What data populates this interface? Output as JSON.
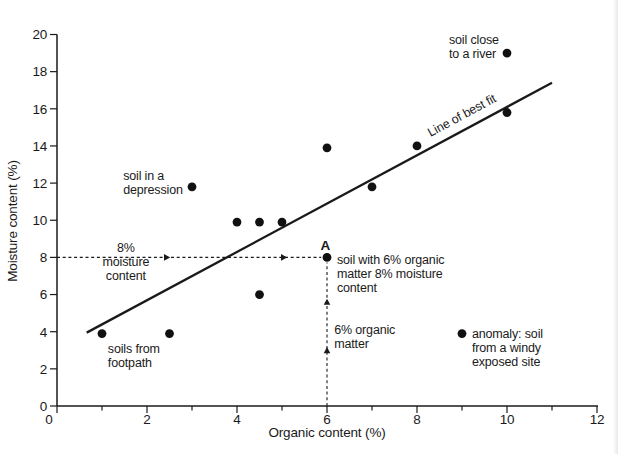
{
  "figure": {
    "background": "#ffffff",
    "ink_color": "#1a1a1a"
  },
  "chart_data": {
    "type": "scatter",
    "title": "",
    "xlabel": "Organic content (%)",
    "ylabel": "Moisture content (%)",
    "xlim": [
      0,
      12
    ],
    "ylim": [
      0,
      20
    ],
    "grid": false,
    "x_major_ticks": [
      0,
      2,
      4,
      6,
      8,
      10,
      12
    ],
    "x_minor_ticks": [
      1,
      3,
      5,
      7,
      9,
      11
    ],
    "y_major_ticks": [
      0,
      2,
      4,
      6,
      8,
      10,
      12,
      14,
      16,
      18,
      20
    ],
    "points": [
      {
        "x": 1,
        "y": 3.9,
        "note": "soils from footpath"
      },
      {
        "x": 2.5,
        "y": 3.9,
        "note": "soils from footpath"
      },
      {
        "x": 3,
        "y": 11.8,
        "note": "soil in a depression"
      },
      {
        "x": 4,
        "y": 9.9
      },
      {
        "x": 4.5,
        "y": 9.9
      },
      {
        "x": 5,
        "y": 9.9
      },
      {
        "x": 4.5,
        "y": 6
      },
      {
        "x": 6,
        "y": 8,
        "label": "A",
        "note": "soil with 6% organic matter 8% moisture content"
      },
      {
        "x": 6,
        "y": 13.9
      },
      {
        "x": 7,
        "y": 11.8
      },
      {
        "x": 8,
        "y": 14
      },
      {
        "x": 10,
        "y": 15.8
      },
      {
        "x": 10,
        "y": 19,
        "note": "soil close to a river"
      },
      {
        "x": 9,
        "y": 3.9,
        "note": "anomaly: soil from a windy exposed site"
      }
    ],
    "best_fit_line": {
      "label": "Line of best fit",
      "x1": 0.66,
      "y1": 3.95,
      "x2": 11.0,
      "y2": 17.4,
      "label_pos": {
        "x": 9.04,
        "y": 15.45
      },
      "label_angle_deg": -28.3
    },
    "guides": [
      {
        "name": "moisture-8-guide",
        "orientation": "horizontal",
        "value": 8,
        "from": 0,
        "to": 5.87,
        "arrows_at": [
          2.4,
          5.0
        ]
      },
      {
        "name": "organic-6-guide",
        "orientation": "vertical",
        "value": 6,
        "from": 0,
        "to": 7.72,
        "arrows_at": [
          2.9,
          5.5
        ]
      }
    ],
    "annotations": [
      {
        "name": "point-a-label",
        "lines": [
          "A"
        ],
        "x": 5.96,
        "y": 8.4,
        "align": "middle",
        "bold": true
      },
      {
        "name": "soil-close-to-a-river-label",
        "lines": [
          "soil close",
          "to a river"
        ],
        "x": 8.71,
        "y": 19.49,
        "align": "start"
      },
      {
        "name": "soil-in-a-depression-label",
        "lines": [
          "soil in a",
          "depression"
        ],
        "x": 1.47,
        "y": 12.19,
        "align": "start"
      },
      {
        "name": "soils-from-footpath-label",
        "lines": [
          "soils from",
          "footpath"
        ],
        "x": 1.13,
        "y": 2.83,
        "align": "start"
      },
      {
        "name": "soil-with-6-percent-organic-label",
        "lines": [
          "soil with 6% organic",
          "matter 8% moisture",
          "content"
        ],
        "x": 6.22,
        "y": 7.67,
        "align": "start"
      },
      {
        "name": "6-percent-organic-matter-label",
        "lines": [
          "6% organic",
          "matter"
        ],
        "x": 6.16,
        "y": 3.9,
        "align": "start"
      },
      {
        "name": "8-percent-moisture-content-label",
        "lines": [
          "8%",
          "moisture",
          "content"
        ],
        "x": 1.53,
        "y": 8.27,
        "align": "middle"
      },
      {
        "name": "anomaly-windy-site-label",
        "lines": [
          "anomaly: soil",
          "from a windy",
          "exposed site"
        ],
        "x": 9.22,
        "y": 3.66,
        "align": "start"
      }
    ]
  }
}
